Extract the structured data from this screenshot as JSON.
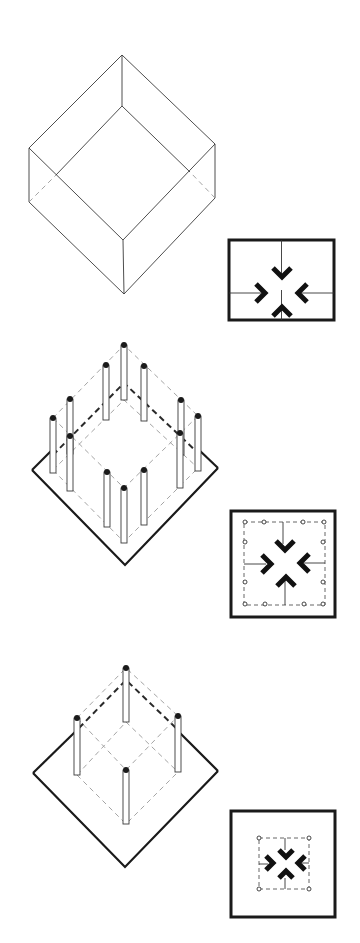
{
  "figure": {
    "panels": [
      {
        "id": "enclosed-volume",
        "iso_view": "solid-walled cube in isometric",
        "plan_view": "square with four inward-pointing chevrons, no column markers",
        "columns": 0
      },
      {
        "id": "perimeter-columns",
        "iso_view": "twelve columns on square base plate with dashed implied volume",
        "plan_view": "square with dashed inner boundary, twelve ring markers, four inward chevrons",
        "columns": 12
      },
      {
        "id": "corner-columns",
        "iso_view": "four corner columns on square base plate with dashed implied volume",
        "plan_view": "square with small dashed inner boundary, four corner ring markers, four inward chevrons",
        "columns": 4
      }
    ],
    "icons": {
      "chevron": "inward-arrow-icon",
      "ring": "column-marker-icon"
    },
    "colors": {
      "ink": "#1a1a1a",
      "light_dash": "#9a9a9a",
      "background": "#ffffff"
    }
  }
}
